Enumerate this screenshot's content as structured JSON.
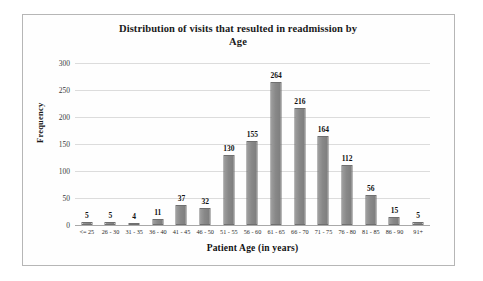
{
  "chart_data": {
    "type": "bar",
    "title": "Distribution of visits that resulted in readmission by Age",
    "title_lines": [
      "Distribution of visits that resulted in readmission by",
      "Age"
    ],
    "xlabel": "Patient Age (in years)",
    "ylabel": "Frequency",
    "ylim": [
      0,
      300
    ],
    "yticks": [
      0,
      50,
      100,
      150,
      200,
      250,
      300
    ],
    "ytick_labels": [
      "0",
      "50",
      "100",
      "150",
      "200",
      "250",
      "300"
    ],
    "grid": true,
    "legend": "none",
    "bar_color": "#8a8a8a",
    "gridline_color": "#dcdcdc",
    "categories": [
      "<= 25",
      "26 - 30",
      "31 - 35",
      "36 - 40",
      "41 - 45",
      "46 - 50",
      "51 - 55",
      "56 - 60",
      "61 - 65",
      "66 - 70",
      "71 - 75",
      "76 - 80",
      "81 - 85",
      "86 - 90",
      "91+"
    ],
    "values": [
      5,
      5,
      4,
      11,
      37,
      32,
      130,
      155,
      264,
      216,
      164,
      112,
      56,
      15,
      5
    ],
    "data_labels": [
      "5",
      "5",
      "4",
      "11",
      "37",
      "32",
      "130",
      "155",
      "264",
      "216",
      "164",
      "112",
      "56",
      "15",
      "5"
    ]
  }
}
